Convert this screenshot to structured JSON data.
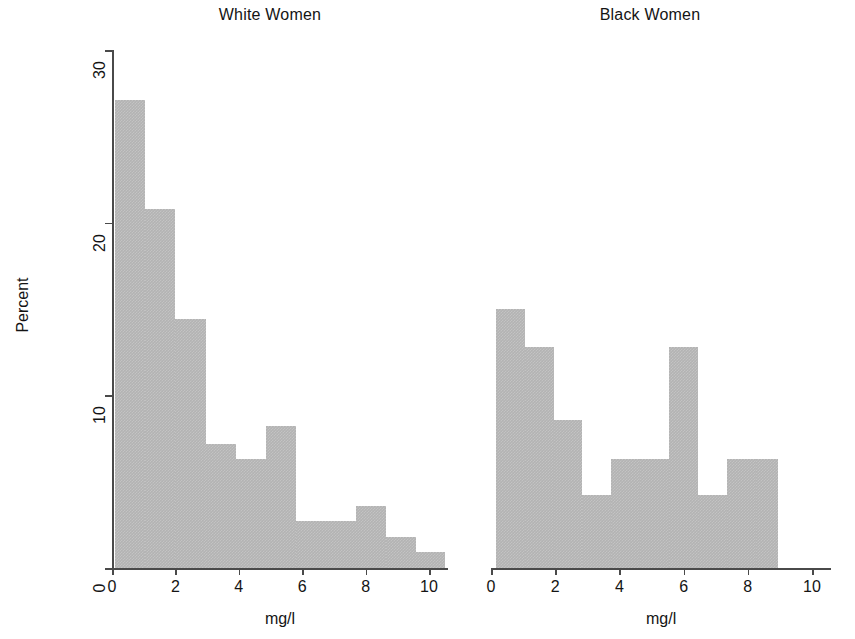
{
  "figure": {
    "ylabel": "Percent",
    "panels": [
      {
        "key": "white_women",
        "title": "White Women",
        "xlabel": "mg/l"
      },
      {
        "key": "black_women",
        "title": "Black Women",
        "xlabel": "mg/l"
      }
    ],
    "y_ticks": [
      "0",
      "10",
      "20",
      "30"
    ],
    "x_ticks": [
      "0",
      "2",
      "4",
      "6",
      "8",
      "10"
    ],
    "bar_color": "#b3b3b3",
    "axis_color": "#4a4a4a"
  },
  "chart_data": [
    {
      "type": "bar",
      "title": "White Women",
      "xlabel": "mg/l",
      "ylabel": "Percent",
      "xlim": [
        0,
        11
      ],
      "ylim": [
        0,
        30
      ],
      "grid": false,
      "legend": "none",
      "bin_edges": [
        0.1,
        1.05,
        2.0,
        2.95,
        3.9,
        4.85,
        5.8,
        6.75,
        7.7,
        8.65,
        9.6,
        10.5
      ],
      "bin_labels": [
        "0.1-1.1",
        "1.1-2.0",
        "2.0-3.0",
        "3.0-3.9",
        "3.9-4.9",
        "4.9-5.8",
        "5.8-6.8",
        "6.8-7.7",
        "7.7-8.7",
        "8.7-9.6",
        "9.6-10.5"
      ],
      "values": [
        27.1,
        20.8,
        14.4,
        7.2,
        6.3,
        8.2,
        2.7,
        2.7,
        3.6,
        1.8,
        0.9
      ]
    },
    {
      "type": "bar",
      "title": "Black Women",
      "xlabel": "mg/l",
      "ylabel": "Percent",
      "xlim": [
        0,
        11
      ],
      "ylim": [
        0,
        30
      ],
      "grid": false,
      "legend": "none",
      "bin_edges": [
        0.15,
        1.05,
        1.95,
        2.85,
        3.75,
        4.65,
        5.55,
        6.45,
        7.35,
        8.25,
        8.95
      ],
      "bin_labels": [
        "0.2-1.1",
        "1.1-2.0",
        "2.0-2.9",
        "2.9-3.8",
        "3.8-4.7",
        "4.7-5.6",
        "5.6-6.5",
        "6.5-7.4",
        "7.4-8.3",
        "8.3-9.0"
      ],
      "values": [
        15.0,
        12.8,
        8.6,
        4.2,
        6.3,
        6.3,
        12.8,
        4.2,
        6.3,
        6.3
      ]
    }
  ]
}
